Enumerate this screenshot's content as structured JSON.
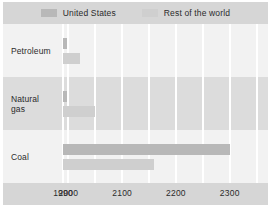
{
  "legend": {
    "entries": [
      {
        "label": "United States",
        "color": "#b8b8b8",
        "swatch_name": "legend-swatch-united-states"
      },
      {
        "label": "Rest of the world",
        "color": "#cfcfcf",
        "swatch_name": "legend-swatch-rest-of-world"
      }
    ]
  },
  "axis": {
    "ticks": [
      {
        "label": "1990",
        "value": 1990
      },
      {
        "label": "2000",
        "value": 2000
      },
      {
        "label": "2100",
        "value": 2100
      },
      {
        "label": "2200",
        "value": 2200
      },
      {
        "label": "2300",
        "value": 2300
      }
    ]
  },
  "categories": [
    {
      "label": "Petroleum",
      "lines": [
        "Petroleum"
      ]
    },
    {
      "label": "Natural gas",
      "lines": [
        "Natural",
        "gas"
      ]
    },
    {
      "label": "Coal",
      "lines": [
        "Coal"
      ]
    }
  ],
  "chart_data": {
    "type": "bar",
    "orientation": "horizontal",
    "title": "",
    "subtitle": "",
    "xlabel": "",
    "ylabel": "",
    "categories": [
      "Petroleum",
      "Natural gas",
      "Coal"
    ],
    "series": [
      {
        "name": "United States",
        "color": "#b8b8b8",
        "values": [
          1998,
          1997,
          2300
        ],
        "note": "bar end year; bars begin at 1990 baseline"
      },
      {
        "name": "Rest of the world",
        "color": "#cfcfcf",
        "values": [
          2022,
          2050,
          2160
        ],
        "note": "bar end year; bars begin at 1990 baseline"
      }
    ],
    "xlim": [
      1990,
      2360
    ],
    "xticks": [
      1990,
      2000,
      2100,
      2200,
      2300
    ],
    "grid": true,
    "grid_orientation": "vertical",
    "legend_position": "top"
  },
  "style": {
    "page_background": "#ffffff",
    "plot_background": "#f2f2f2",
    "band_background": "#dcdcdc",
    "legend_band_background": "#d6d6d6",
    "axis_band_background": "#d6d6d6",
    "gridline_color": "#ffffff",
    "text_color": "#2b2b2b"
  }
}
